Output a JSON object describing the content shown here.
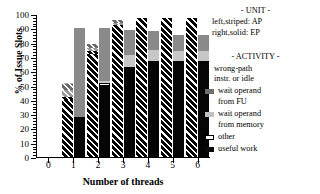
{
  "chart_data": {
    "type": "bar",
    "title": "",
    "xlabel": "Number of threads",
    "ylabel": "% of Issue Slots",
    "categories": [
      "1",
      "2",
      "3",
      "4",
      "5",
      "6"
    ],
    "ylim": [
      0,
      100
    ],
    "ytick_labels": [
      "0",
      "10",
      "20",
      "30",
      "40",
      "50",
      "60",
      "70",
      "80",
      "90",
      "100"
    ],
    "xtick_labels": [
      "0",
      "1",
      "2",
      "3",
      "4",
      "5",
      "6"
    ],
    "grid": false,
    "legend_position": "right",
    "stacked": true,
    "bars_per_group": 2,
    "segment_order_bottom_to_top": [
      "useful work",
      "other",
      "wait operand from memory",
      "wait operand from FU",
      "wrong-path instr. or idle"
    ],
    "series": [
      {
        "name": "AP (left, striped)",
        "unit": "AP",
        "pattern": "striped",
        "stack": [
          {
            "segment": "useful work",
            "values": [
              40,
              72,
              92,
              97,
              97,
              97
            ]
          },
          {
            "segment": "other",
            "values": [
              2,
              2,
              0,
              0,
              0,
              0
            ]
          },
          {
            "segment": "wait operand from memory",
            "values": [
              5,
              2,
              2,
              0,
              0,
              0
            ]
          },
          {
            "segment": "wait operand from FU",
            "values": [
              4,
              3,
              2,
              0,
              0,
              0
            ]
          },
          {
            "segment": "wrong-path instr. or idle",
            "values": [
              1,
              0,
              0,
              0,
              0,
              0
            ]
          }
        ],
        "totals": [
          52,
          79,
          96,
          97,
          97,
          97
        ]
      },
      {
        "name": "EP (right, solid)",
        "unit": "EP",
        "pattern": "solid",
        "stack": [
          {
            "segment": "useful work",
            "values": [
              28,
              50,
              63,
              67,
              67,
              67
            ]
          },
          {
            "segment": "other",
            "values": [
              0,
              2,
              0,
              0,
              0,
              0
            ]
          },
          {
            "segment": "wait operand from memory",
            "values": [
              0,
              1,
              8,
              8,
              7,
              7
            ]
          },
          {
            "segment": "wait operand from FU",
            "values": [
              62,
              37,
              18,
              13,
              11,
              11
            ]
          },
          {
            "segment": "wrong-path instr. or idle",
            "values": [
              0,
              0,
              0,
              0,
              0,
              0
            ]
          }
        ],
        "totals": [
          90,
          90,
          89,
          88,
          85,
          85
        ]
      }
    ]
  },
  "legend": {
    "unit_heading": "- UNIT -",
    "unit_lines": [
      "left,striped: AP",
      "right,solid: EP"
    ],
    "activity_heading": "- ACTIVITY -",
    "activity_plain_lines": [
      "wrong-path",
      "instr. or idle"
    ],
    "items": [
      {
        "swatch": "fu",
        "lines": [
          "wait operand",
          "from FU"
        ]
      },
      {
        "swatch": "mem",
        "lines": [
          "wait operand",
          "from memory"
        ]
      },
      {
        "swatch": "other",
        "lines": [
          "other"
        ]
      },
      {
        "swatch": "useful",
        "lines": [
          "useful work"
        ]
      }
    ]
  },
  "colors": {
    "useful_work": "#050505",
    "other": "#ffffff",
    "wait_memory": "#c7c7c7",
    "wait_fu": "#8a8a8a",
    "wrong_path": "#e8e8e8",
    "axis": "#000000",
    "background": "#ffffff"
  }
}
